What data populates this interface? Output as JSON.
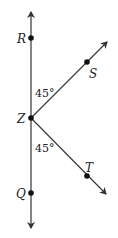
{
  "diagram": {
    "type": "geometry-angles",
    "points": {
      "R": {
        "label": "R"
      },
      "S": {
        "label": "S"
      },
      "Z": {
        "label": "Z"
      },
      "T": {
        "label": "T"
      },
      "Q": {
        "label": "Q"
      }
    },
    "angles": {
      "upper": "45°",
      "lower": "45°"
    },
    "colors": {
      "line": "#333333",
      "point": "#111111"
    }
  }
}
